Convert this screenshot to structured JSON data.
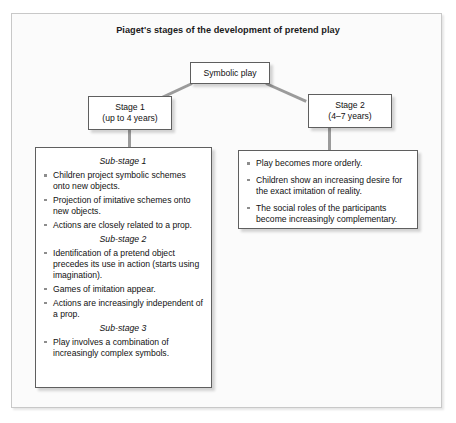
{
  "figure": {
    "title": "Piaget's stages of the development of pretend play"
  },
  "nodes": {
    "root": {
      "label": "Symbolic play"
    },
    "stage1": {
      "line1": "Stage 1",
      "line2": "(up to 4 years)"
    },
    "stage2": {
      "line1": "Stage 2",
      "line2": "(4–7 years)"
    }
  },
  "stage1_panel": {
    "groups": [
      {
        "heading": "Sub-stage 1",
        "items": [
          "Children project symbolic schemes onto new objects.",
          "Projection of imitative schemes onto new objects.",
          "Actions are closely related to a prop."
        ]
      },
      {
        "heading": "Sub-stage 2",
        "items": [
          "Identification of a pretend object precedes its use in action (starts using imagination).",
          "Games of imitation appear.",
          "Actions are increasingly independent of a prop."
        ]
      },
      {
        "heading": "Sub-stage 3",
        "items": [
          "Play involves a combination of increasingly complex symbols."
        ]
      }
    ]
  },
  "stage2_panel": {
    "items": [
      "Play becomes more orderly.",
      "Children show an increasing desire for the exact imitation of reality.",
      "The social roles of the participants become increasingly complementary."
    ]
  },
  "colors": {
    "frame_border": "#c8c8c8",
    "frame_fill": "#fbfbfb",
    "node_border": "#5f5f5f",
    "node_fill": "#ffffff",
    "connector": "#9b9b9b",
    "bullet": "#8d8d8d",
    "text": "#111111"
  }
}
